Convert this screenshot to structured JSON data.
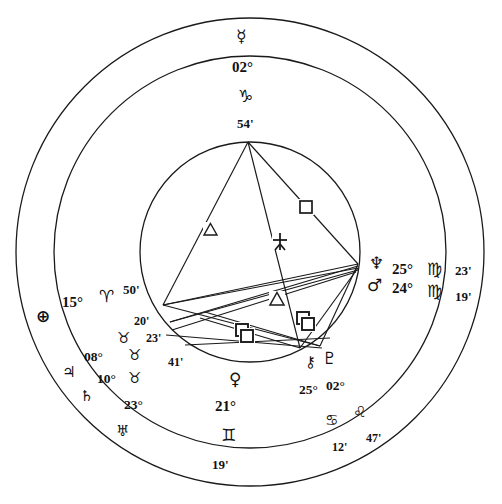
{
  "chart": {
    "type": "astrological-wheel",
    "background_color": "#ffffff",
    "line_color": "#1a1a1a",
    "outer_circle": {
      "cx": 250,
      "cy": 252,
      "r": 234
    },
    "middle_circle": {
      "cx": 250,
      "cy": 252,
      "r": 196
    },
    "inner_circle": {
      "cx": 250,
      "cy": 252,
      "r": 110
    }
  },
  "placements": [
    {
      "id": "mercury",
      "planet_glyph": "☿",
      "planet_name": "mercury-glyph",
      "degree": "02°",
      "sign_glyph": "♑",
      "sign_name": "capricorn-glyph",
      "minute": "54'"
    },
    {
      "id": "neptune",
      "planet_glyph": "♆",
      "planet_name": "neptune-glyph",
      "degree": "25°",
      "sign_glyph": "♍",
      "sign_name": "virgo-glyph",
      "minute": "23'"
    },
    {
      "id": "mars",
      "planet_glyph": "♂",
      "planet_name": "mars-glyph",
      "degree": "24°",
      "sign_glyph": "♍",
      "sign_name": "virgo-glyph",
      "minute": "19'"
    },
    {
      "id": "chiron",
      "planet_glyph": "⚷",
      "planet_name": "chiron-glyph",
      "degree": "25°",
      "sign_glyph": "♋",
      "sign_name": "cancer-glyph",
      "minute": "12'"
    },
    {
      "id": "pluto",
      "planet_glyph": "♇",
      "planet_name": "pluto-glyph",
      "degree": "02°",
      "sign_glyph": "♌",
      "sign_name": "leo-glyph",
      "minute": "47'"
    },
    {
      "id": "venus",
      "planet_glyph": "♀",
      "planet_name": "venus-glyph",
      "degree": "21°",
      "sign_glyph": "♊",
      "sign_name": "gemini-glyph",
      "minute": "19'"
    },
    {
      "id": "uranus",
      "planet_glyph": "♅",
      "planet_name": "uranus-glyph",
      "degree": "23°",
      "sign_glyph": "♉",
      "sign_name": "taurus-glyph",
      "minute": "41'"
    },
    {
      "id": "saturn",
      "planet_glyph": "♄",
      "planet_name": "saturn-glyph",
      "degree": "10°",
      "sign_glyph": "♉",
      "sign_name": "taurus-glyph",
      "minute": "23'"
    },
    {
      "id": "jupiter",
      "planet_glyph": "♃",
      "planet_name": "jupiter-glyph",
      "degree": "08°",
      "sign_glyph": "♉",
      "sign_name": "taurus-glyph",
      "minute": "20'"
    },
    {
      "id": "earth",
      "planet_glyph": "⊕",
      "planet_name": "earth-glyph",
      "degree": "15°",
      "sign_glyph": "♈",
      "sign_name": "aries-glyph",
      "minute": "50'"
    }
  ],
  "aspect_markers": [
    {
      "id": "trine-upper-left",
      "symbol": "△",
      "name": "trine-marker"
    },
    {
      "id": "quincunx-center",
      "symbol": "⚻",
      "name": "quincunx-marker"
    },
    {
      "id": "square-upper-right",
      "symbol": "□",
      "name": "square-marker"
    },
    {
      "id": "trine-lower-center",
      "symbol": "△",
      "name": "trine-marker"
    },
    {
      "id": "square-lower-right-a",
      "symbol": "□",
      "name": "square-marker"
    },
    {
      "id": "square-lower-right-b",
      "symbol": "□",
      "name": "square-marker"
    },
    {
      "id": "square-lower-left-a",
      "symbol": "□",
      "name": "square-marker"
    },
    {
      "id": "square-lower-left-b",
      "symbol": "□",
      "name": "square-marker"
    }
  ],
  "labels": {
    "mercury_glyph": "☿",
    "mercury_degree": "02°",
    "mercury_sign": "♑",
    "mercury_minute": "54'",
    "neptune_glyph": "♆",
    "neptune_degree": "25°",
    "neptune_sign": "♍",
    "neptune_minute": "23'",
    "mars_glyph": "♂",
    "mars_degree": "24°",
    "mars_sign": "♍",
    "mars_minute": "19'",
    "chiron_glyph": "⚷",
    "chiron_degree": "25°",
    "chiron_sign": "♋",
    "chiron_minute": "12'",
    "pluto_glyph": "♇",
    "pluto_degree": "02°",
    "pluto_sign": "♌",
    "pluto_minute": "47'",
    "venus_glyph": "♀",
    "venus_degree": "21°",
    "venus_sign": "♊",
    "venus_minute": "19'",
    "uranus_glyph": "♅",
    "uranus_degree": "23°",
    "uranus_sign": "♉",
    "uranus_minute": "41'",
    "saturn_glyph": "♄",
    "saturn_degree": "10°",
    "saturn_sign": "♉",
    "saturn_minute": "23'",
    "jupiter_glyph": "♃",
    "jupiter_degree": "08°",
    "jupiter_sign": "♉",
    "jupiter_minute": "20'",
    "earth_glyph": "⊕",
    "earth_degree": "15°",
    "earth_sign": "♈",
    "earth_minute": "50'",
    "aspect_trine_1": "△",
    "aspect_quincunx": "⚻",
    "aspect_square_1": "□",
    "aspect_trine_2": "△"
  }
}
